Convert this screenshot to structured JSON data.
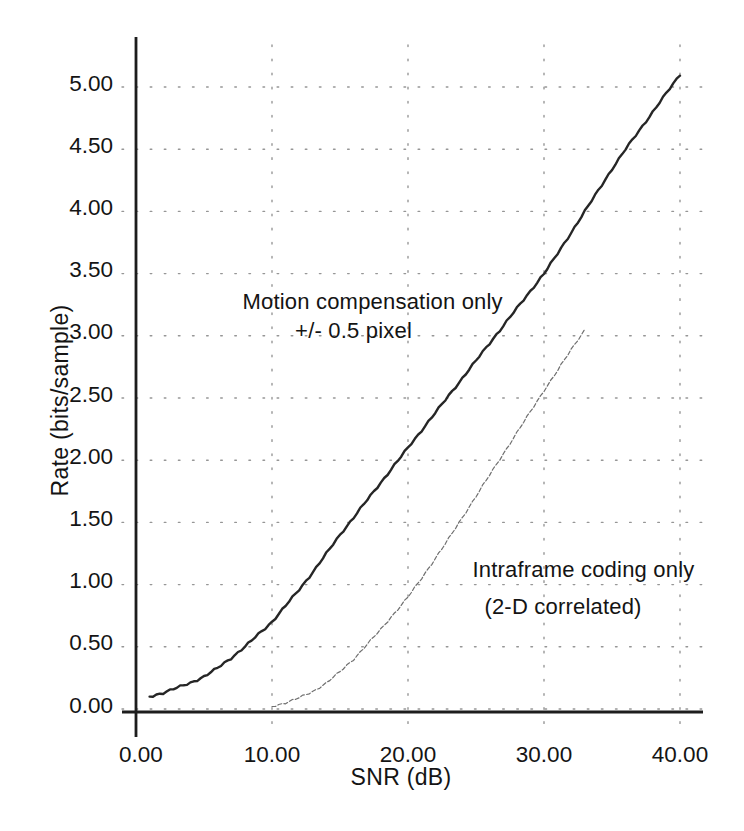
{
  "figure": {
    "background": "#ffffff"
  },
  "chart_data": {
    "type": "line",
    "title": "",
    "xlabel": "SNR (dB)",
    "ylabel": "Rate (bits/sample)",
    "xlim": [
      0,
      40
    ],
    "ylim": [
      0,
      5
    ],
    "grid": "dotted",
    "legend_position": "inline-annotations",
    "x_ticks": {
      "values": [
        0,
        10,
        20,
        30,
        40
      ],
      "labels": [
        "0.00",
        "10.00",
        "20.00",
        "30.00",
        "40.00"
      ]
    },
    "y_ticks": {
      "values": [
        0,
        0.5,
        1.0,
        1.5,
        2.0,
        2.5,
        3.0,
        3.5,
        4.0,
        4.5,
        5.0
      ],
      "labels": [
        "0.00",
        "0.50",
        "1.00",
        "1.50",
        "2.00",
        "2.50",
        "3.00",
        "3.50",
        "4.00",
        "4.50",
        "5.00"
      ]
    },
    "series": [
      {
        "name": "Motion compensation only +/- 0.5 pixel",
        "style": "solid",
        "color": "#262626",
        "width": 2.4,
        "x": [
          1,
          2,
          3,
          4,
          5,
          6,
          7,
          8,
          9,
          10,
          11,
          12,
          13,
          14,
          15,
          16,
          17,
          18,
          19,
          20,
          21,
          22,
          23,
          24,
          25,
          26,
          27,
          28,
          29,
          30,
          31,
          32,
          33,
          34,
          35,
          36,
          37,
          38,
          39,
          40
        ],
        "y": [
          0.1,
          0.13,
          0.17,
          0.21,
          0.26,
          0.33,
          0.41,
          0.5,
          0.6,
          0.7,
          0.83,
          0.96,
          1.1,
          1.25,
          1.4,
          1.54,
          1.68,
          1.82,
          1.96,
          2.1,
          2.24,
          2.38,
          2.52,
          2.66,
          2.8,
          2.94,
          3.08,
          3.22,
          3.36,
          3.5,
          3.66,
          3.83,
          4.0,
          4.17,
          4.34,
          4.5,
          4.65,
          4.8,
          4.95,
          5.1
        ]
      },
      {
        "name": "Intraframe coding only (2-D correlated)",
        "style": "thin-broken",
        "color": "#6f6f6f",
        "width": 1.2,
        "x": [
          10,
          11,
          12,
          13,
          14,
          15,
          16,
          17,
          18,
          19,
          20,
          21,
          22,
          23,
          24,
          25,
          26,
          27,
          28,
          29,
          30,
          31,
          32,
          33
        ],
        "y": [
          0.02,
          0.05,
          0.09,
          0.14,
          0.21,
          0.3,
          0.4,
          0.52,
          0.64,
          0.77,
          0.9,
          1.05,
          1.21,
          1.37,
          1.54,
          1.71,
          1.88,
          2.05,
          2.22,
          2.39,
          2.56,
          2.72,
          2.89,
          3.05
        ]
      }
    ],
    "annotations": [
      {
        "text": "Motion compensation only",
        "x": 17.4,
        "y": 3.27
      },
      {
        "text": "+/- 0.5 pixel",
        "x": 16.0,
        "y": 3.04
      },
      {
        "text": "Intraframe coding only",
        "x": 32.9,
        "y": 1.12
      },
      {
        "text": "(2-D correlated)",
        "x": 31.4,
        "y": 0.82
      }
    ],
    "colors": {
      "axis": "#1d1d1d",
      "grid": "#969696",
      "text": "#141414"
    }
  }
}
